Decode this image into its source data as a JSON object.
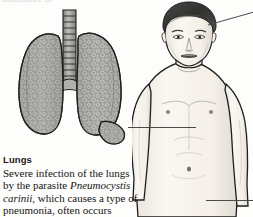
{
  "figure": {
    "top_cut_text": "appearance of",
    "illustrations": {
      "lungs": {
        "name": "lungs-with-infection",
        "parts": [
          "trachea",
          "left-lung",
          "right-lung",
          "bronchi"
        ],
        "fill_color": "#9a9a97",
        "outline_color": "#1e1e1e",
        "texture": "mottled-stippled-infection"
      },
      "body": {
        "name": "male-upper-body",
        "parts": [
          "head",
          "face",
          "neck",
          "shoulders",
          "chest",
          "abdomen",
          "arms"
        ],
        "hair_color": "#3b3b3b",
        "skin_color": "#f3efe9",
        "outline_color": "#1e1e1e"
      }
    },
    "leader_lines": [
      {
        "name": "leader-to-head",
        "from": "head",
        "direction": "up-right"
      },
      {
        "name": "leader-to-lungs",
        "from": "lungs",
        "to": "chest",
        "direction": "horizontal"
      },
      {
        "name": "leader-to-abdomen",
        "from": "abdomen",
        "direction": "right"
      }
    ]
  },
  "caption": {
    "title": "Lungs",
    "body_line_1": "Severe infection of the lungs",
    "body_line_2_pre": "by the parasite ",
    "body_line_2_italic": "Pneumocystis",
    "body_line_3_italic": "carinii",
    "body_line_3_post": ", which causes a type",
    "body_line_4": "of pneumonia, often occurs"
  }
}
